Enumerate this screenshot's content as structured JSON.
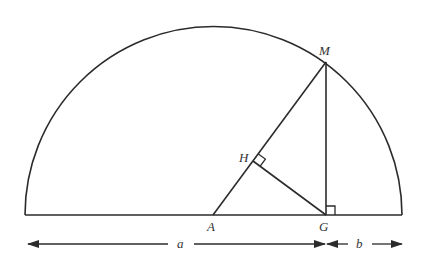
{
  "diagram": {
    "type": "geometry",
    "colors": {
      "stroke": "#2b2b2b",
      "text": "#333333",
      "background": "#ffffff"
    },
    "points": {
      "M": {
        "label": "M",
        "x": 326,
        "y": 62
      },
      "H": {
        "label": "H",
        "x": 253,
        "y": 161
      },
      "A": {
        "label": "A",
        "x": 213,
        "y": 215
      },
      "G": {
        "label": "G",
        "x": 326,
        "y": 215
      }
    },
    "semicircle": {
      "cx": 213.5,
      "cy": 215,
      "r": 188.5
    },
    "dimensions": {
      "a": {
        "label": "a",
        "from_x": 28,
        "to_x": 326,
        "y": 244
      },
      "b": {
        "label": "b",
        "from_x": 326,
        "to_x": 402,
        "y": 244
      }
    },
    "right_angle_marks": [
      "H",
      "G"
    ]
  }
}
